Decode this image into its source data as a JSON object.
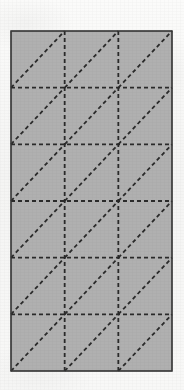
{
  "figure": {
    "type": "triangulated-mesh-diagram",
    "canvas": {
      "width": 184,
      "height": 390
    },
    "background_color": "#f7f7f6",
    "plate": {
      "name": "rectangular-plate",
      "x": 11,
      "y": 31,
      "width": 161,
      "height": 340,
      "fill_color": "#b0b0b0",
      "border_color": "#3a3a3a",
      "border_width": 1.2
    },
    "mesh": {
      "columns": 3,
      "rows": 6,
      "cell_width": 53.67,
      "cell_height": 56.67,
      "total_cells": 18,
      "total_triangles": 36,
      "diagonal_direction": "bottom-left-to-top-right",
      "line_color": "#2a2a2a",
      "line_width": 1.8,
      "dash_length": 4,
      "gap_length": 3,
      "vertical_line_x": [
        11,
        64.67,
        118.33,
        172
      ],
      "horizontal_line_y": [
        31,
        87.67,
        144.33,
        201,
        257.67,
        314.33,
        371
      ],
      "interior_vertical_x": [
        64.67,
        118.33
      ],
      "interior_horizontal_y": [
        87.67,
        144.33,
        201,
        257.67,
        314.33
      ]
    },
    "diagonals": [
      {
        "cell": "r0c0",
        "x1": 11,
        "y1": 87.67,
        "x2": 64.67,
        "y2": 31
      },
      {
        "cell": "r0c1",
        "x1": 64.67,
        "y1": 87.67,
        "x2": 118.33,
        "y2": 31
      },
      {
        "cell": "r0c2",
        "x1": 118.33,
        "y1": 87.67,
        "x2": 172,
        "y2": 31
      },
      {
        "cell": "r1c0",
        "x1": 11,
        "y1": 144.33,
        "x2": 64.67,
        "y2": 87.67
      },
      {
        "cell": "r1c1",
        "x1": 64.67,
        "y1": 144.33,
        "x2": 118.33,
        "y2": 87.67
      },
      {
        "cell": "r1c2",
        "x1": 118.33,
        "y1": 144.33,
        "x2": 172,
        "y2": 87.67
      },
      {
        "cell": "r2c0",
        "x1": 11,
        "y1": 201,
        "x2": 64.67,
        "y2": 144.33
      },
      {
        "cell": "r2c1",
        "x1": 64.67,
        "y1": 201,
        "x2": 118.33,
        "y2": 144.33
      },
      {
        "cell": "r2c2",
        "x1": 118.33,
        "y1": 201,
        "x2": 172,
        "y2": 144.33
      },
      {
        "cell": "r3c0",
        "x1": 11,
        "y1": 257.67,
        "x2": 64.67,
        "y2": 201
      },
      {
        "cell": "r3c1",
        "x1": 64.67,
        "y1": 257.67,
        "x2": 118.33,
        "y2": 201
      },
      {
        "cell": "r3c2",
        "x1": 118.33,
        "y1": 257.67,
        "x2": 172,
        "y2": 201
      },
      {
        "cell": "r4c0",
        "x1": 11,
        "y1": 314.33,
        "x2": 64.67,
        "y2": 257.67
      },
      {
        "cell": "r4c1",
        "x1": 64.67,
        "y1": 314.33,
        "x2": 118.33,
        "y2": 257.67
      },
      {
        "cell": "r4c2",
        "x1": 118.33,
        "y1": 314.33,
        "x2": 172,
        "y2": 257.67
      },
      {
        "cell": "r5c0",
        "x1": 11,
        "y1": 371,
        "x2": 64.67,
        "y2": 314.33
      },
      {
        "cell": "r5c1",
        "x1": 64.67,
        "y1": 371,
        "x2": 118.33,
        "y2": 314.33
      },
      {
        "cell": "r5c2",
        "x1": 118.33,
        "y1": 371,
        "x2": 172,
        "y2": 314.33
      }
    ],
    "labels": []
  }
}
